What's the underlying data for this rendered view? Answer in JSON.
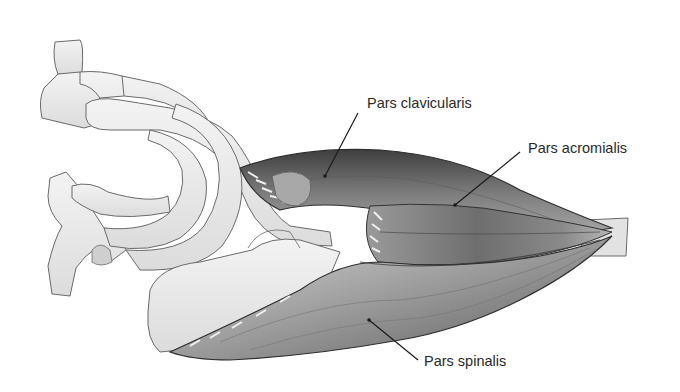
{
  "figure": {
    "background": "#ffffff",
    "colors": {
      "bone_fill": "#ededed",
      "bone_stroke": "#6a6a6a",
      "muscle_dark": "#4a4a4a",
      "muscle_mid": "#8a8a8a",
      "muscle_light": "#c8c8c8",
      "tendon_fill": "#e2e2e2",
      "leader_line": "#1a1a1a",
      "label_text": "#2a2a2a"
    },
    "labels": [
      {
        "id": "pars-clavicularis",
        "text": "Pars clavicularis"
      },
      {
        "id": "pars-acromialis",
        "text": "Pars acromialis"
      },
      {
        "id": "pars-spinalis",
        "text": "Pars spinalis"
      }
    ]
  }
}
